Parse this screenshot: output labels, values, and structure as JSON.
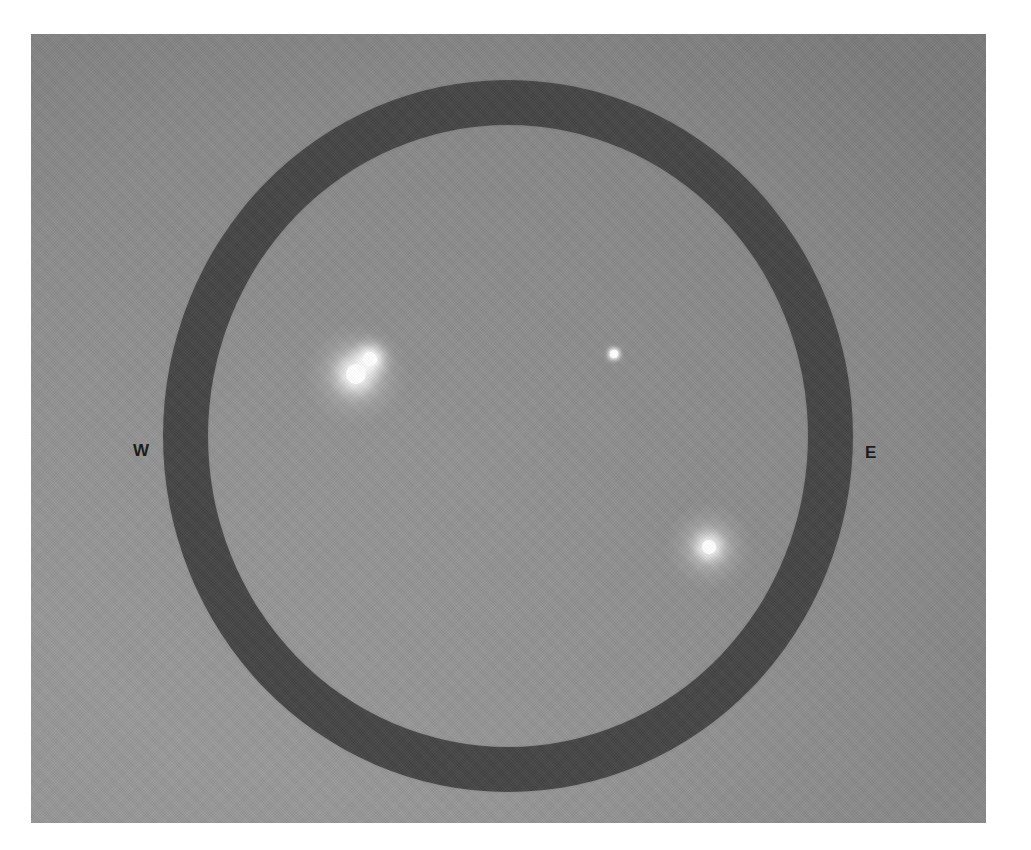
{
  "figure": {
    "canvas_width": 1031,
    "canvas_height": 850,
    "border_color": "#ffffff"
  },
  "plate": {
    "background_color": "#8b8b8b",
    "left": 31,
    "top": 34,
    "width": 955,
    "height": 789
  },
  "ring": {
    "name": "occulting-ring",
    "color": "#4b4b4b",
    "center_x": 508,
    "center_y": 436,
    "outer_radius_x": 345,
    "outer_radius_y": 356,
    "thickness": 45
  },
  "cardinals": [
    {
      "label": "W",
      "x": 133,
      "y": 442
    },
    {
      "label": "E",
      "x": 865,
      "y": 444
    }
  ],
  "objects": [
    {
      "id": "object-primary",
      "label": "",
      "x": 356,
      "y": 374,
      "radius": 10,
      "halo_radius": 52,
      "brightness": "brightest",
      "color": "#ffffff"
    },
    {
      "id": "object-companion",
      "label": "",
      "x": 370,
      "y": 359,
      "radius": 7,
      "halo_radius": 26,
      "brightness": "bright",
      "color": "#ffffff"
    },
    {
      "id": "object-faint-center",
      "label": "",
      "x": 614,
      "y": 354,
      "radius": 4,
      "halo_radius": 9,
      "brightness": "faint",
      "color": "#ffffff"
    },
    {
      "id": "object-lower-right",
      "label": "",
      "x": 709,
      "y": 547,
      "radius": 7,
      "halo_radius": 44,
      "brightness": "bright",
      "color": "#ffffff"
    }
  ]
}
